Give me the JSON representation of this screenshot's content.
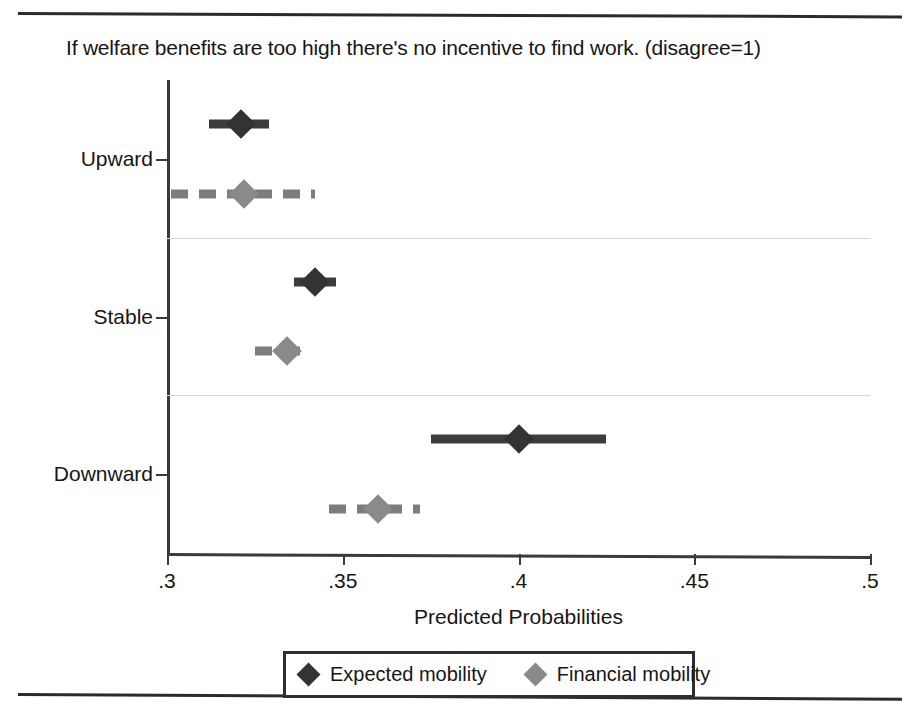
{
  "figure": {
    "title": "If welfare benefits are too high there's no incentive to find work. (disagree=1)",
    "rules": {
      "top": "horizontal-rule",
      "bottom": "horizontal-rule"
    }
  },
  "chart_data": {
    "type": "scatter",
    "orientation": "horizontal",
    "title": "If welfare benefits are too high there's no incentive to find work. (disagree=1)",
    "xlabel": "Predicted Probabilities",
    "ylabel": "",
    "xlim": [
      0.3,
      0.5
    ],
    "xticks": [
      0.3,
      0.35,
      0.4,
      0.45,
      0.5
    ],
    "xticklabels": [
      ".3",
      ".35",
      ".4",
      ".45",
      ".5"
    ],
    "categories": [
      "Upward",
      "Stable",
      "Downward"
    ],
    "grid": "horizontal-faint",
    "legend_position": "below-axis-center",
    "series": [
      {
        "name": "Expected mobility",
        "marker": "diamond",
        "color": "#333333",
        "line_style": "solid",
        "values": [
          0.321,
          0.342,
          0.4
        ],
        "ci_low": [
          0.312,
          0.336,
          0.375
        ],
        "ci_high": [
          0.329,
          0.348,
          0.425
        ]
      },
      {
        "name": "Financial mobility",
        "marker": "diamond",
        "color": "#8a8a8a",
        "line_style": "dashed",
        "values": [
          0.322,
          0.334,
          0.36
        ],
        "ci_low": [
          0.301,
          0.325,
          0.346
        ],
        "ci_high": [
          0.342,
          0.341,
          0.372
        ]
      }
    ]
  },
  "legend": {
    "items": [
      {
        "label": "Expected mobility",
        "color": "#333333"
      },
      {
        "label": "Financial mobility",
        "color": "#8a8a8a"
      }
    ]
  }
}
